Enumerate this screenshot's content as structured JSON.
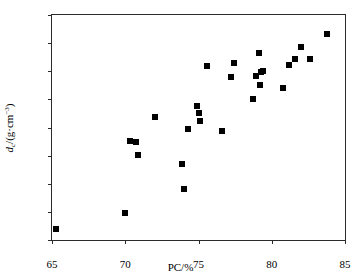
{
  "chart_data": {
    "type": "scatter",
    "title": "",
    "xlabel": "PC/%",
    "ylabel": "d_c/(g·cm^-3)",
    "ylabel_parts": {
      "symbol": "d",
      "subscript": "c",
      "unit_open": "/(g·cm",
      "exponent": "−3",
      "unit_close": ")"
    },
    "xlim": [
      65,
      85
    ],
    "ylim": [
      1.3,
      2.1
    ],
    "xticks": [
      65,
      70,
      75,
      80,
      85
    ],
    "yticks": [
      1.3,
      1.4,
      1.5,
      1.6,
      1.7,
      1.8,
      1.9,
      2.0,
      2.1
    ],
    "xtick_labels": [
      "65",
      "70",
      "75",
      "80",
      "85"
    ],
    "ytick_labels": [
      "1.3",
      "1.4",
      "1.5",
      "1.6",
      "1.7",
      "1.8",
      "1.9",
      "2.0",
      "2.1"
    ],
    "grid": false,
    "legend": null,
    "marker": "filled-square",
    "marker_color": "#000000",
    "marker_size_px": 6,
    "n_points": 28,
    "x": [
      65.3,
      70.0,
      70.3,
      70.7,
      70.9,
      72.0,
      73.9,
      74.0,
      74.3,
      74.9,
      75.0,
      75.1,
      75.6,
      76.6,
      77.2,
      77.4,
      78.7,
      78.9,
      79.1,
      79.2,
      79.3,
      79.4,
      80.8,
      81.2,
      81.6,
      82.0,
      82.6,
      83.8
    ],
    "y": [
      1.34,
      1.395,
      1.653,
      1.65,
      1.602,
      1.736,
      1.57,
      1.483,
      1.695,
      1.775,
      1.752,
      1.724,
      1.917,
      1.688,
      1.879,
      1.931,
      1.8,
      1.884,
      1.966,
      1.852,
      1.899,
      1.902,
      1.84,
      1.921,
      1.944,
      1.986,
      1.944,
      2.032
    ],
    "points": [
      {
        "x": 65.3,
        "y": 1.34
      },
      {
        "x": 70.0,
        "y": 1.395
      },
      {
        "x": 70.3,
        "y": 1.653
      },
      {
        "x": 70.7,
        "y": 1.65
      },
      {
        "x": 70.9,
        "y": 1.602
      },
      {
        "x": 72.0,
        "y": 1.736
      },
      {
        "x": 73.9,
        "y": 1.57
      },
      {
        "x": 74.0,
        "y": 1.483
      },
      {
        "x": 74.3,
        "y": 1.695
      },
      {
        "x": 74.9,
        "y": 1.775
      },
      {
        "x": 75.0,
        "y": 1.752
      },
      {
        "x": 75.1,
        "y": 1.724
      },
      {
        "x": 75.6,
        "y": 1.917
      },
      {
        "x": 76.6,
        "y": 1.688
      },
      {
        "x": 77.2,
        "y": 1.879
      },
      {
        "x": 77.4,
        "y": 1.931
      },
      {
        "x": 78.7,
        "y": 1.8
      },
      {
        "x": 78.9,
        "y": 1.884
      },
      {
        "x": 79.1,
        "y": 1.966
      },
      {
        "x": 79.2,
        "y": 1.852
      },
      {
        "x": 79.3,
        "y": 1.899
      },
      {
        "x": 79.4,
        "y": 1.902
      },
      {
        "x": 80.8,
        "y": 1.84
      },
      {
        "x": 81.2,
        "y": 1.921
      },
      {
        "x": 81.6,
        "y": 1.944
      },
      {
        "x": 82.0,
        "y": 1.986
      },
      {
        "x": 82.6,
        "y": 1.944
      },
      {
        "x": 83.8,
        "y": 2.032
      }
    ]
  }
}
